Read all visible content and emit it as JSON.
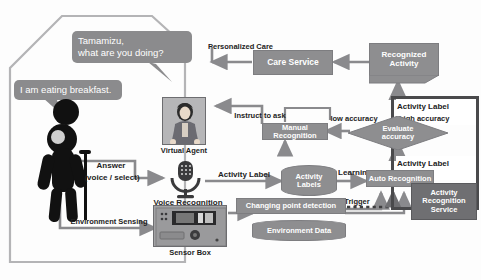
{
  "diagram": {
    "type": "flow-diagram",
    "colors": {
      "box_fill": "#8e8e90",
      "box_text": "#ffffff",
      "panel_border": "#4a4a4c",
      "arrow": "#8a8a8d",
      "label_text": "#1d1d1d",
      "dark_box": "#6f6f72"
    }
  },
  "home": {
    "speech_question": "Tamamizu,\nwhat are you doing?",
    "speech_question_line1": "Tamamizu,",
    "speech_question_line2": "what are you doing?",
    "speech_answer": "I am eating breakfast.",
    "person_label": "elderly-person"
  },
  "devices": {
    "virtual_agent": "Virtual Agent",
    "voice_recognition": "Voice Recognition",
    "sensor_box": "Sensor Box"
  },
  "edges": {
    "personalized_care": "Personalized Care",
    "answer": "Answer\n(voice / select)",
    "answer_line1": "Answer",
    "answer_line2": "(voice / select)",
    "environment_sensing": "Environment Sensing",
    "activity_label_mid": "Activity Label",
    "learning": "Learning",
    "trigger": "Trigger",
    "instruct_to_ask": "Instruct to ask",
    "low_accuracy": "low accuracy",
    "high_accuracy": "high accuracy",
    "activity_label_top": "Activity Label",
    "activity_label_right": "Activity Label"
  },
  "nodes": {
    "care_service": "Care Service",
    "recognized_activity": "Recognized\nActivity",
    "recognized_activity_line1": "Recognized",
    "recognized_activity_line2": "Activity",
    "manual_recognition": "Manual Recognition",
    "evaluate_accuracy": "Evaluate\naccuracy",
    "evaluate_accuracy_line1": "Evaluate",
    "evaluate_accuracy_line2": "accuracy",
    "activity_labels": "Activity\nLabels",
    "activity_labels_line1": "Activity",
    "activity_labels_line2": "Labels",
    "auto_recognition": "Auto Recognition",
    "changing_point_detection": "Changing point detection",
    "environment_data": "Environment Data",
    "service_panel": "Activity\nRecognition\nService",
    "service_panel_line1": "Activity",
    "service_panel_line2": "Recognition",
    "service_panel_line3": "Service"
  }
}
